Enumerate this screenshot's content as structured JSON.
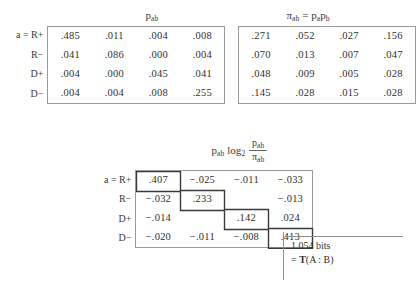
{
  "figure": {
    "caption_kind": "information-theory-matrices"
  },
  "matrix_pab": {
    "title_main": "p",
    "title_sub": "ab",
    "row_labels": [
      "a = R+",
      "R−",
      "D+",
      "D−"
    ],
    "rows": [
      [
        ".485",
        ".011",
        ".004",
        ".008"
      ],
      [
        ".041",
        ".086",
        ".000",
        ".004"
      ],
      [
        ".004",
        ".000",
        ".045",
        ".041"
      ],
      [
        ".004",
        ".004",
        ".008",
        ".255"
      ]
    ]
  },
  "matrix_piab": {
    "title_pi": "π",
    "title_pi_sub": "ab",
    "title_eq": "=",
    "title_pa": "p",
    "title_pa_sub": "a",
    "title_pb": "p",
    "title_pb_sub": "b",
    "rows": [
      [
        ".271",
        ".052",
        ".027",
        ".156"
      ],
      [
        ".070",
        ".013",
        ".007",
        ".047"
      ],
      [
        ".048",
        ".009",
        ".005",
        ".028"
      ],
      [
        ".145",
        ".028",
        ".015",
        ".028"
      ]
    ]
  },
  "matrix_terms": {
    "title_p": "p",
    "title_p_sub": "ab",
    "title_log": "log",
    "title_log_sub": "2",
    "title_frac_num": "p",
    "title_frac_num_sub": "ab",
    "title_frac_den": "π",
    "title_frac_den_sub": "ab",
    "row_labels": [
      "a = R+",
      "R−",
      "D+",
      "D−"
    ],
    "rows": [
      [
        ".407",
        "−.025",
        "−.011",
        "−.033"
      ],
      [
        "−.032",
        ".233",
        "",
        "−.013"
      ],
      [
        "−.014",
        "",
        ".142",
        ".024"
      ],
      [
        "−.020",
        "−.011",
        "−.008",
        ".413"
      ]
    ]
  },
  "annotation": {
    "line1": "1.054 bits",
    "line2_prefix": "= ",
    "line2_T": "T",
    "line2_arg": "(A : B)"
  },
  "colors": {
    "ink": "#2f2f2f",
    "rule": "#9a9a9a",
    "stair": "#3a3a3a",
    "page": "#ffffff"
  }
}
